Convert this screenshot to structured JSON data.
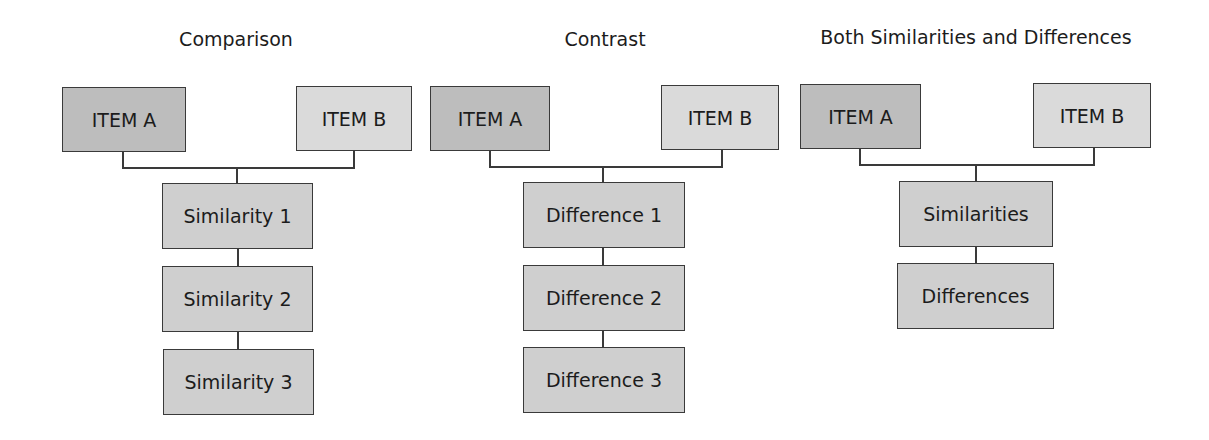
{
  "diagrams": [
    {
      "title": "Comparison",
      "item_a": "ITEM A",
      "item_b": "ITEM B",
      "children": [
        "Similarity 1",
        "Similarity 2",
        "Similarity 3"
      ]
    },
    {
      "title": "Contrast",
      "item_a": "ITEM A",
      "item_b": "ITEM B",
      "children": [
        "Difference 1",
        "Difference 2",
        "Difference 3"
      ]
    },
    {
      "title": "Both Similarities and Differences",
      "item_a": "ITEM A",
      "item_b": "ITEM B",
      "children": [
        "Similarities",
        "Differences"
      ]
    }
  ],
  "colors": {
    "item_a_fill": "#bdbdbd",
    "item_b_fill": "#dadada",
    "child_fill": "#cfcfcf",
    "stroke": "#3a3a3a"
  }
}
